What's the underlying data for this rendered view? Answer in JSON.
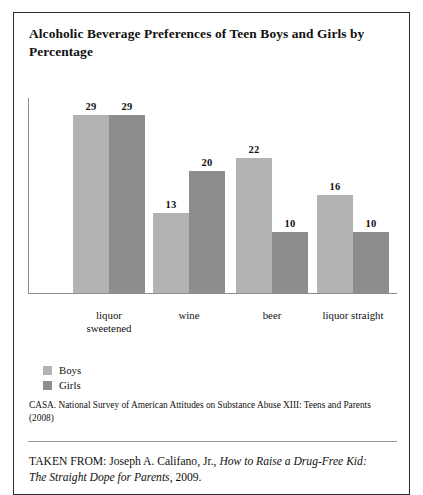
{
  "card": {
    "title": "Alcoholic Beverage Preferences of Teen Boys and Girls by Percentage",
    "source_note": "CASA. National Survey of American Attitudes on Substance Abuse XIII: Teens and Parents (2008)",
    "taken_from": {
      "prefix": "TAKEN FROM: Joseph A. Califano, Jr., ",
      "work_title": "How to Raise a Drug-Free Kid: The Straight Dope for Parents",
      "suffix": ", 2009."
    }
  },
  "colors": {
    "boys": "#b3b3b3",
    "girls": "#8d8d8d",
    "axis": "#8d8d8d",
    "border": "#2b2b2b",
    "text": "#101010"
  },
  "legend": {
    "items": [
      {
        "label": "Boys",
        "color": "#b3b3b3"
      },
      {
        "label": "Girls",
        "color": "#8d8d8d"
      }
    ]
  },
  "chart_data": {
    "type": "bar",
    "title": "Alcoholic Beverage Preferences of Teen Boys and Girls by Percentage",
    "xlabel": "",
    "ylabel": "",
    "ylim": [
      0,
      32
    ],
    "grid": false,
    "legend_position": "below-left",
    "value_labels": true,
    "categories": [
      "liquor sweetened",
      "wine",
      "beer",
      "liquor straight"
    ],
    "category_lines": [
      [
        "liquor",
        "sweetened"
      ],
      [
        "wine"
      ],
      [
        "beer"
      ],
      [
        "liquor straight"
      ]
    ],
    "series": [
      {
        "name": "Boys",
        "color": "#b3b3b3",
        "values": [
          29,
          13,
          22,
          16
        ]
      },
      {
        "name": "Girls",
        "color": "#8d8d8d",
        "values": [
          29,
          20,
          10,
          10
        ]
      }
    ]
  }
}
